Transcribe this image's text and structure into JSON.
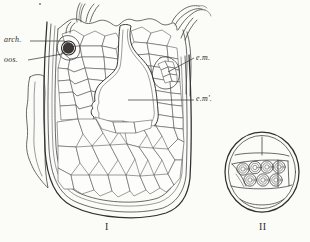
{
  "plate": {
    "kind": "botanical-line-engraving",
    "background_color": "#fbfbf8",
    "ink_color": "#3a3a3a",
    "width": 310,
    "height": 242
  },
  "labels": {
    "archegonium": "arch.",
    "oospore": "oos.",
    "embryo_outer": "e.m.",
    "embryo_inner": "e.m'."
  },
  "figures": {
    "one": {
      "number": "I",
      "caption": "I",
      "description": "longitudinal section of ovule-like body with cellular tissue, archegonium and oospore at upper left, central flask-shaped cavity, branched filaments at upper right, thick outer coat"
    },
    "two": {
      "number": "II",
      "caption": "II",
      "description": "transverse section: oval outline with transverse partitions and a band of seven rounded cells in two rows",
      "cell_count": 7,
      "row_counts": [
        4,
        3
      ]
    }
  },
  "icons": {
    "archegonium_marker": "dark-oval-icon",
    "oospore_marker": "filled-circle-icon"
  }
}
